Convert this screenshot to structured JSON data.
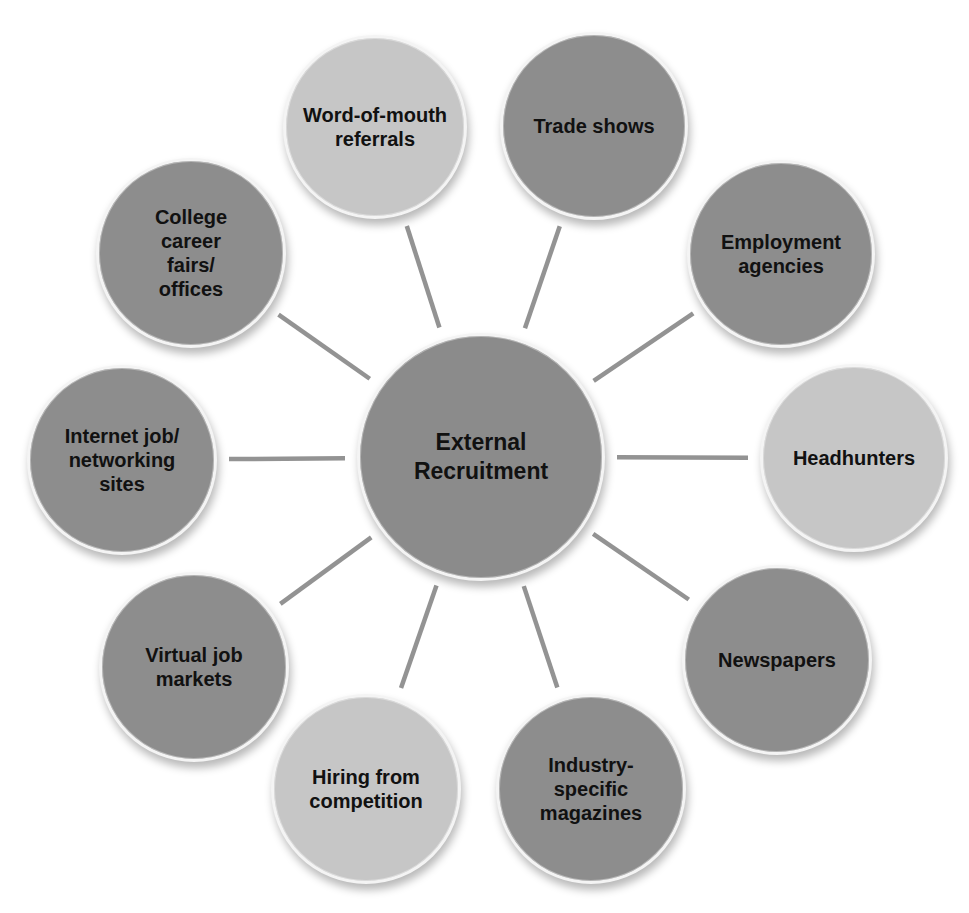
{
  "diagram": {
    "type": "hub-and-spoke",
    "colors": {
      "dark_node": "#8d8d8d",
      "light_node": "#c6c6c6",
      "center_node": "#8b8b8b",
      "connector": "#939393",
      "background": "#ffffff",
      "text": "#111111"
    },
    "center": {
      "label": "External\nRecruitment",
      "cx": 481,
      "cy": 457,
      "r": 124,
      "shade": "center"
    },
    "nodes": [
      {
        "id": "word-of-mouth-referrals",
        "label": "Word-of-mouth\nreferrals",
        "cx": 375,
        "cy": 127,
        "r": 92,
        "shade": "light"
      },
      {
        "id": "trade-shows",
        "label": "Trade shows",
        "cx": 594,
        "cy": 126,
        "r": 94,
        "shade": "dark"
      },
      {
        "id": "employment-agencies",
        "label": "Employment\nagencies",
        "cx": 781,
        "cy": 254,
        "r": 94,
        "shade": "dark"
      },
      {
        "id": "headhunters",
        "label": "Headhunters",
        "cx": 854,
        "cy": 458,
        "r": 94,
        "shade": "light"
      },
      {
        "id": "newspapers",
        "label": "Newspapers",
        "cx": 777,
        "cy": 660,
        "r": 95,
        "shade": "dark"
      },
      {
        "id": "industry-specific-magazines",
        "label": "Industry-\nspecific\nmagazines",
        "cx": 591,
        "cy": 789,
        "r": 95,
        "shade": "dark"
      },
      {
        "id": "hiring-from-competition",
        "label": "Hiring from\ncompetition",
        "cx": 366,
        "cy": 789,
        "r": 95,
        "shade": "light"
      },
      {
        "id": "virtual-job-markets",
        "label": "Virtual job\nmarkets",
        "cx": 194,
        "cy": 667,
        "r": 95,
        "shade": "dark"
      },
      {
        "id": "internet-job-networking-sites",
        "label": "Internet job/\nnetworking\nsites",
        "cx": 122,
        "cy": 460,
        "r": 95,
        "shade": "dark"
      },
      {
        "id": "college-career-fairs-offices",
        "label": "College\ncareer\nfairs/\noffices",
        "cx": 191,
        "cy": 253,
        "r": 95,
        "shade": "dark"
      }
    ],
    "connector_width": 4.5,
    "connector_gap": 12
  }
}
